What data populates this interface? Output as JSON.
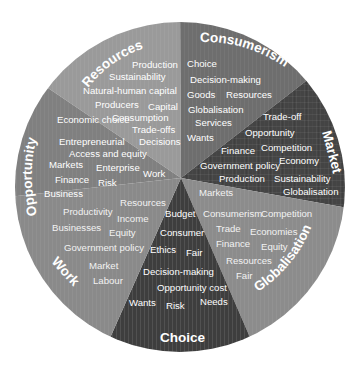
{
  "diagram": {
    "type": "concept-wheel",
    "segments": [
      {
        "id": "resources",
        "title": "Resources",
        "color": "#9a9a9a",
        "terms": [
          "Production",
          "Sustainability",
          "Natural-human capital",
          "Producers",
          "Capital",
          "Consumption",
          "Trade-offs",
          "Decisions"
        ]
      },
      {
        "id": "consumerism",
        "title": "Consumerism",
        "color": "#6e6e6e",
        "terms": [
          "Choice",
          "Decision-making",
          "Goods",
          "Resources",
          "Globalisation",
          "Services",
          "Wants"
        ]
      },
      {
        "id": "market",
        "title": "Market",
        "color": "#444444",
        "terms": [
          "Trade-off",
          "Opportunity",
          "Finance",
          "Competition",
          "Economy",
          "Government policy",
          "Production",
          "Sustainability",
          "Globalisation"
        ]
      },
      {
        "id": "globalisation",
        "title": "Globalisation",
        "color": "#8c8c8c",
        "terms": [
          "Markets",
          "Consumerism",
          "Competition",
          "Trade",
          "Economies",
          "Finance",
          "Equity",
          "Resources",
          "Fair"
        ]
      },
      {
        "id": "choice",
        "title": "Choice",
        "color": "#3e3e3e",
        "terms": [
          "Budget",
          "Consumer",
          "Ethics",
          "Fair",
          "Decision-making",
          "Opportunity cost",
          "Wants",
          "Risk",
          "Needs"
        ]
      },
      {
        "id": "work",
        "title": "Work",
        "color": "#8a8a8a",
        "terms": [
          "Resources",
          "Productivity",
          "Income",
          "Businesses",
          "Equity",
          "Government policy",
          "Market",
          "Labour"
        ]
      },
      {
        "id": "opportunity",
        "title": "Opportunity",
        "color": "#808080",
        "terms": [
          "Economic choice",
          "Entrepreneurial",
          "Access and equity",
          "Markets",
          "Enterprise",
          "Work",
          "Finance",
          "Risk",
          "Business"
        ]
      }
    ]
  }
}
